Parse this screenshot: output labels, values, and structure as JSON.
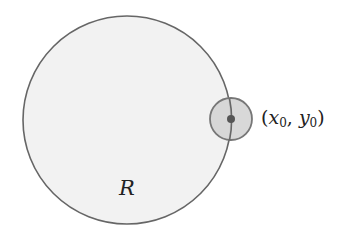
{
  "diagram": {
    "region": {
      "label": "R",
      "center": [
        127,
        120
      ],
      "radius": 104,
      "fill": "#f2f2f2",
      "stroke": "#666666"
    },
    "neighborhood": {
      "center": [
        231,
        119
      ],
      "radius": 21,
      "fill": "#d4d4d4",
      "stroke": "#777777"
    },
    "point": {
      "center": [
        231,
        119
      ],
      "radius": 4,
      "fill": "#555555",
      "label": {
        "open": "(",
        "x_var": "x",
        "x_sub": "0",
        "sep": ", ",
        "y_var": "y",
        "y_sub": "0",
        "close": ")"
      }
    }
  }
}
